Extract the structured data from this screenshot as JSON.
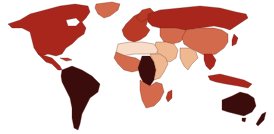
{
  "map": {
    "type": "choropleth-world",
    "legend": null,
    "title": null,
    "palette": {
      "darkest": "#3a0c0c",
      "dark": "#a8261c",
      "medium_dark": "#b83a26",
      "medium": "#d46a4c",
      "medium_light": "#e08a68",
      "light": "#f0b890",
      "lightest": "#f8dcc8",
      "background": "#ffffff"
    },
    "regions": [
      {
        "name": "North America",
        "shade": "dark"
      },
      {
        "name": "Greenland",
        "shade": "medium"
      },
      {
        "name": "Central America",
        "shade": "dark"
      },
      {
        "name": "South America",
        "shade": "darkest"
      },
      {
        "name": "Europe",
        "shade": "medium_dark"
      },
      {
        "name": "Russia",
        "shade": "dark"
      },
      {
        "name": "Central Asia",
        "shade": "medium"
      },
      {
        "name": "China",
        "shade": "medium"
      },
      {
        "name": "North Africa",
        "shade": "lightest"
      },
      {
        "name": "Middle East",
        "shade": "light"
      },
      {
        "name": "India",
        "shade": "light"
      },
      {
        "name": "Southeast Asia",
        "shade": "dark"
      },
      {
        "name": "West Africa",
        "shade": "medium"
      },
      {
        "name": "Central Africa",
        "shade": "darkest"
      },
      {
        "name": "East Africa",
        "shade": "light"
      },
      {
        "name": "Southern Africa",
        "shade": "medium"
      },
      {
        "name": "Madagascar",
        "shade": "medium_dark"
      },
      {
        "name": "Indonesia",
        "shade": "dark"
      },
      {
        "name": "Japan",
        "shade": "dark"
      },
      {
        "name": "Australia",
        "shade": "darkest"
      },
      {
        "name": "New Zealand",
        "shade": "darkest"
      }
    ]
  }
}
